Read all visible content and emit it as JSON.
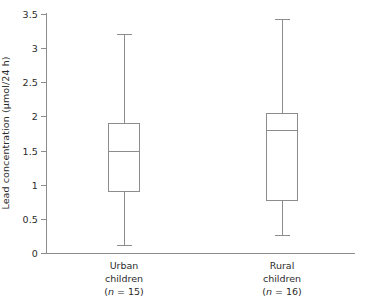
{
  "chart_data": {
    "type": "box",
    "title": "",
    "xlabel": "",
    "ylabel": "Lead concentration (μmol/24 h)",
    "ylim": [
      0,
      3.5
    ],
    "ytick_labels": [
      "3.5",
      "3",
      "2.5",
      "2",
      "1.5",
      "1",
      "0.5",
      "0"
    ],
    "ytick_values": [
      3.5,
      3,
      2.5,
      2,
      1.5,
      1,
      0.5,
      0
    ],
    "grid": false,
    "legend": "none",
    "categories": [
      "Urban children",
      "Rural children"
    ],
    "boxes": [
      {
        "category": "Urban children",
        "name_line1": "Urban",
        "name_line2": "children",
        "n_label": "(n = 15)",
        "n": 15,
        "whisker_low": 0.12,
        "q1": 0.89,
        "median": 1.5,
        "q3": 1.91,
        "whisker_high": 3.2
      },
      {
        "category": "Rural children",
        "name_line1": "Rural",
        "name_line2": "children",
        "n_label": "(n = 16)",
        "n": 16,
        "whisker_low": 0.26,
        "q1": 0.76,
        "median": 1.8,
        "q3": 2.05,
        "whisker_high": 3.42
      }
    ],
    "colors": {
      "line": "#8c8c8c",
      "text": "#2b2b2b",
      "background": "#ffffff"
    }
  }
}
